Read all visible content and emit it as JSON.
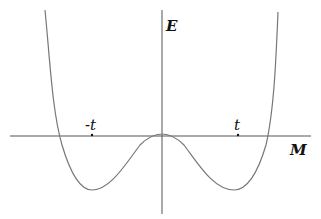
{
  "diagram": {
    "type": "double-well potential curve",
    "axes": {
      "y_label": "E",
      "x_label": "M"
    },
    "ticks": [
      {
        "label": "-t",
        "position": "left minimum"
      },
      {
        "label": "t",
        "position": "right minimum"
      }
    ],
    "colors": {
      "axis": "#333333",
      "curve": "#777777",
      "text": "#111111"
    }
  }
}
